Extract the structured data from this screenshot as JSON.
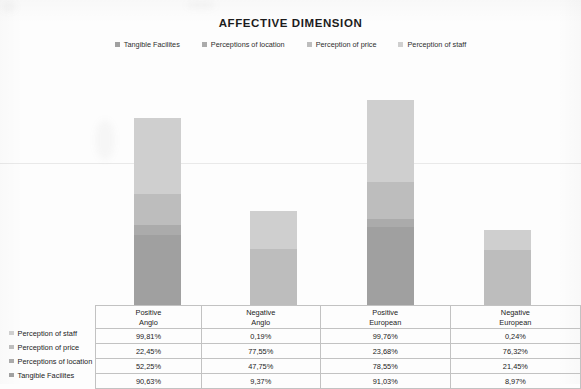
{
  "chart_data": {
    "type": "bar",
    "subtype": "stacked-100-percent",
    "title": "AFFECTIVE DIMENSION",
    "xlabel": "",
    "ylabel": "",
    "ylim": [
      0,
      100
    ],
    "grid": false,
    "legend_position": "top-center",
    "categories": [
      "Positive Anglo",
      "Negative Anglo",
      "Positive European",
      "Negative European"
    ],
    "category_lines": [
      [
        "Positive",
        "Anglo"
      ],
      [
        "Negative",
        "Anglo"
      ],
      [
        "Positive",
        "European"
      ],
      [
        "Negative",
        "European"
      ]
    ],
    "series": [
      {
        "name": "Tangible Facilites",
        "color": "#a0a0a0",
        "values": [
          90.63,
          9.37,
          91.03,
          8.97
        ],
        "labels": [
          "90,63%",
          "9,37%",
          "91,03%",
          "8,97%"
        ]
      },
      {
        "name": "Perceptions of location",
        "color": "#ababab",
        "values": [
          52.25,
          47.75,
          78.55,
          21.45
        ],
        "labels": [
          "52,25%",
          "47,75%",
          "78,55%",
          "21,45%"
        ]
      },
      {
        "name": "Perception of price",
        "color": "#bdbdbd",
        "values": [
          22.45,
          77.55,
          23.68,
          76.32
        ],
        "labels": [
          "22,45%",
          "77,55%",
          "23,68%",
          "76,32%"
        ]
      },
      {
        "name": "Perception of staff",
        "color": "#cfcfcf",
        "values": [
          99.81,
          0.19,
          99.76,
          0.24
        ],
        "labels": [
          "99,81%",
          "0,19%",
          "99,76%",
          "0,24%"
        ]
      }
    ],
    "bar_totals_px": [
      187,
      94,
      205,
      75
    ],
    "bar_segments_px": [
      [
        70,
        10,
        31,
        76
      ],
      [
        0,
        0,
        56,
        38
      ],
      [
        78,
        8,
        37,
        82
      ],
      [
        0,
        0,
        55,
        20
      ]
    ]
  },
  "legend": {
    "items": [
      {
        "label": "Tangible Facilites",
        "color": "#a0a0a0"
      },
      {
        "label": "Perceptions of location",
        "color": "#ababab"
      },
      {
        "label": "Perception of price",
        "color": "#bdbdbd"
      },
      {
        "label": "Perception of staff",
        "color": "#cfcfcf"
      }
    ]
  },
  "table": {
    "header_rows": [
      [
        "Positive",
        "Negative",
        "Positive",
        "Negative"
      ],
      [
        "Anglo",
        "Anglo",
        "European",
        "European"
      ]
    ],
    "rows": [
      {
        "label": "Perception of staff",
        "color": "#cfcfcf",
        "values": [
          "99,81%",
          "0,19%",
          "99,76%",
          "0,24%"
        ]
      },
      {
        "label": "Perception of price",
        "color": "#bdbdbd",
        "values": [
          "22,45%",
          "77,55%",
          "23,68%",
          "76,32%"
        ]
      },
      {
        "label": "Perceptions of location",
        "color": "#ababab",
        "values": [
          "52,25%",
          "47,75%",
          "78,55%",
          "21,45%"
        ]
      },
      {
        "label": "Tangible Facilites",
        "color": "#a0a0a0",
        "values": [
          "90,63%",
          "9,37%",
          "91,03%",
          "8,97%"
        ]
      }
    ]
  }
}
